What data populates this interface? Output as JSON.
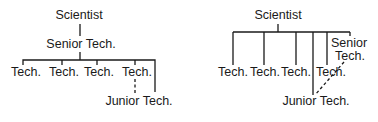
{
  "left_chart": {
    "top": "Scientist",
    "middle": "Senior Tech.",
    "subordinates": [
      "Tech.",
      "Tech.",
      "Tech.",
      "Tech."
    ],
    "junior": "Junior Tech."
  },
  "right_chart": {
    "top": "Scientist",
    "subordinates": [
      "Tech.",
      "Tech.",
      "Tech.",
      "Tech."
    ],
    "senior_line1": "Senior",
    "senior_line2": "Tech.",
    "junior": "Junior Tech."
  }
}
